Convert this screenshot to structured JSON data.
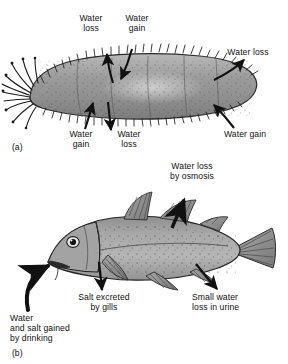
{
  "figure": {
    "background_color": "#ffffff",
    "ink_color": "#111111"
  },
  "panels": [
    {
      "id": "a",
      "marker": "(a)",
      "organism": "sea-cucumber",
      "organism_role": "osmoconformer",
      "labels": [
        {
          "name": "water-loss-top-left",
          "text": "Water\nloss",
          "align": "center"
        },
        {
          "name": "water-gain-top-mid",
          "text": "Water\ngain",
          "align": "center"
        },
        {
          "name": "water-loss-top-right",
          "text": "Water loss",
          "align": "center"
        },
        {
          "name": "water-gain-bottom-left",
          "text": "Water\ngain",
          "align": "center"
        },
        {
          "name": "water-loss-bottom-mid",
          "text": "Water\nloss",
          "align": "center"
        },
        {
          "name": "water-gain-bottom-right",
          "text": "Water gain",
          "align": "center"
        }
      ]
    },
    {
      "id": "b",
      "marker": "(b)",
      "organism": "marine-bony-fish",
      "organism_role": "osmoregulator",
      "labels": [
        {
          "name": "water-loss-by-osmosis",
          "text": "Water loss\nby osmosis",
          "align": "center"
        },
        {
          "name": "salt-excreted-by-gills",
          "text": "Salt excreted\nby gills",
          "align": "center"
        },
        {
          "name": "small-water-loss-in-urine",
          "text": "Small water\nloss in urine",
          "align": "left"
        },
        {
          "name": "water-and-salt-gained-by-drinking",
          "text": "Water\nand salt gained\nby drinking",
          "align": "left"
        }
      ]
    }
  ],
  "text": {
    "a_water_loss_top": "Water\nloss",
    "a_water_gain_top": "Water\ngain",
    "a_water_loss_right": "Water loss",
    "a_water_gain_bottom": "Water\ngain",
    "a_water_loss_bottom": "Water\nloss",
    "a_water_gain_right": "Water gain",
    "a_marker": "(a)",
    "b_water_loss_osmosis": "Water loss\nby osmosis",
    "b_salt_gills": "Salt excreted\nby gills",
    "b_urine": "Small water\nloss in urine",
    "b_drinking": "Water\nand salt gained\nby drinking",
    "b_marker": "(b)"
  }
}
